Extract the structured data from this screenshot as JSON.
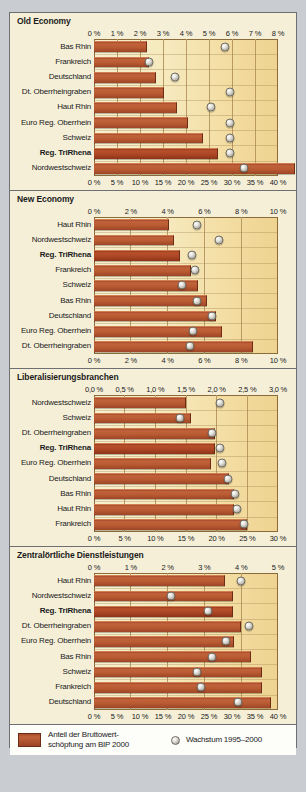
{
  "legend": {
    "bar_label_line1": "Anteil der Bruttowert-",
    "bar_label_line2": "schöpfung am BIP 2000",
    "dot_label": "Wachstum 1995–2000",
    "bar_color": "#b05730",
    "dot_color": "#cfcdc6"
  },
  "chart_data": [
    {
      "type": "bar",
      "title": "Old Economy",
      "label_axis": "bar",
      "top_axis": {
        "name": "Wachstum 1995–2000",
        "ticks": [
          "0 %",
          "1 %",
          "2 %",
          "3 %",
          "4 %",
          "5 %",
          "6 %",
          "7 %",
          "8 %"
        ],
        "values": [
          0,
          1,
          2,
          3,
          4,
          5,
          6,
          7,
          8
        ],
        "min": 0,
        "max": 8
      },
      "bottom_axis": {
        "name": "Anteil der Bruttowertschöpfung am BIP 2000",
        "ticks": [
          "0 %",
          "5 %",
          "10 %",
          "15 %",
          "20 %",
          "25 %",
          "30 %",
          "35 %",
          "40 %"
        ],
        "values": [
          0,
          5,
          10,
          15,
          20,
          25,
          30,
          35,
          40
        ],
        "min": 0,
        "max": 40
      },
      "categories": [
        "Bas Rhin",
        "Frankreich",
        "Deutschland",
        "Dt. Oberrheingraben",
        "Haut Rhin",
        "Euro Reg. Oberrhein",
        "Schweiz",
        "Reg. TriRhena",
        "Nordwestschweiz"
      ],
      "highlight": "Reg. TriRhena",
      "series": [
        {
          "name": "Anteil der Bruttowertschöpfung am BIP 2000",
          "axis": "bottom",
          "values": [
            11.4,
            11.7,
            13.2,
            15.0,
            17.8,
            20.3,
            23.4,
            26.8,
            43.5
          ]
        },
        {
          "name": "Wachstum 1995–2000",
          "axis": "top",
          "values": [
            5.7,
            2.4,
            3.5,
            5.9,
            5.1,
            5.9,
            5.9,
            5.9,
            6.5
          ]
        }
      ]
    },
    {
      "type": "bar",
      "title": "New Economy",
      "top_axis": {
        "name": "Wachstum 1995–2000",
        "ticks": [
          "0 %",
          "2 %",
          "4 %",
          "6 %",
          "8 %",
          "10 %"
        ],
        "values": [
          0,
          2,
          4,
          6,
          8,
          10
        ],
        "min": 0,
        "max": 10
      },
      "bottom_axis": {
        "name": "Anteil der Bruttowertschöpfung am BIP 2000",
        "ticks": [
          "0 %",
          "2 %",
          "4 %",
          "6 %",
          "8 %",
          "10 %"
        ],
        "values": [
          0,
          2,
          4,
          6,
          8,
          10
        ],
        "min": 0,
        "max": 10
      },
      "categories": [
        "Haut Rhin",
        "Nordwestschweiz",
        "Reg. TriRhena",
        "Frankreich",
        "Schweiz",
        "Bas Rhin",
        "Deutschland",
        "Euro Reg. Oberrhein",
        "Dt. Oberrheingraben"
      ],
      "highlight": "Reg. TriRhena",
      "series": [
        {
          "name": "Anteil der Bruttowertschöpfung am BIP 2000",
          "axis": "bottom",
          "values": [
            4.0,
            4.3,
            4.6,
            5.2,
            5.6,
            6.1,
            6.6,
            6.9,
            8.6
          ]
        },
        {
          "name": "Wachstum 1995–2000",
          "axis": "top",
          "values": [
            5.6,
            6.8,
            5.3,
            5.5,
            4.8,
            5.6,
            6.4,
            5.4,
            5.2
          ]
        }
      ]
    },
    {
      "type": "bar",
      "title": "Liberalisierungsbranchen",
      "top_axis": {
        "name": "Wachstum 1995–2000",
        "ticks": [
          "0,0 %",
          "0,5 %",
          "1,0 %",
          "1,5 %",
          "2,0 %",
          "2,5 %",
          "3,0 %"
        ],
        "values": [
          0,
          0.5,
          1.0,
          1.5,
          2.0,
          2.5,
          3.0
        ],
        "min": 0,
        "max": 3.0
      },
      "bottom_axis": {
        "name": "Anteil der Bruttowertschöpfung am BIP 2000",
        "ticks": [
          "0 %",
          "5 %",
          "10 %",
          "15 %",
          "20 %",
          "25 %",
          "30 %"
        ],
        "values": [
          0,
          5,
          10,
          15,
          20,
          25,
          30
        ],
        "min": 0,
        "max": 30
      },
      "categories": [
        "Nordwestschweiz",
        "Schweiz",
        "Dt. Oberrheingraben",
        "Reg. TriRhena",
        "Euro Reg. Oberrhein",
        "Deutschland",
        "Bas Rhin",
        "Haut Rhin",
        "Frankreich"
      ],
      "highlight": "Reg. TriRhena",
      "series": [
        {
          "name": "Anteil der Bruttowertschöpfung am BIP 2000",
          "axis": "bottom",
          "values": [
            14.8,
            15.6,
            19.6,
            19.6,
            18.9,
            21.9,
            22.6,
            22.6,
            24.8
          ]
        },
        {
          "name": "Wachstum 1995–2000",
          "axis": "top",
          "values": [
            2.05,
            1.4,
            1.92,
            2.05,
            2.08,
            2.18,
            2.3,
            2.33,
            2.45
          ]
        }
      ]
    },
    {
      "type": "bar",
      "title": "Zentralörtliche Dienstleistungen",
      "top_axis": {
        "name": "Wachstum 1995–2000",
        "ticks": [
          "0 %",
          "1 %",
          "2 %",
          "3 %",
          "4 %",
          "5 %"
        ],
        "values": [
          0,
          1,
          2,
          3,
          4,
          5
        ],
        "min": 0,
        "max": 5
      },
      "bottom_axis": {
        "name": "Anteil der Bruttowertschöpfung am BIP 2000",
        "ticks": [
          "0 %",
          "5 %",
          "10 %",
          "15 %",
          "20 %",
          "25 %",
          "30 %",
          "35 %",
          "40 %"
        ],
        "values": [
          0,
          5,
          10,
          15,
          20,
          25,
          30,
          35,
          40
        ],
        "min": 0,
        "max": 40
      },
      "categories": [
        "Haut Rhin",
        "Nordwestschweiz",
        "Reg. TriRhena",
        "Dt. Oberrheingraben",
        "Euro Reg. Oberrhein",
        "Bas Rhin",
        "Schweiz",
        "Frankreich",
        "Deutschland"
      ],
      "highlight": "Reg. TriRhena",
      "series": [
        {
          "name": "Anteil der Bruttowertschöpfung am BIP 2000",
          "axis": "bottom",
          "values": [
            28.3,
            30.0,
            30.0,
            31.8,
            30.2,
            34.0,
            36.4,
            36.4,
            38.2
          ]
        },
        {
          "name": "Wachstum 1995–2000",
          "axis": "top",
          "values": [
            4.0,
            2.1,
            3.1,
            4.2,
            3.6,
            3.2,
            2.8,
            2.9,
            3.9
          ]
        }
      ]
    }
  ]
}
